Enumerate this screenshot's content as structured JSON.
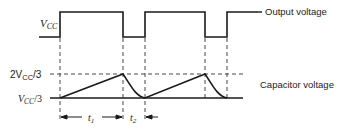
{
  "diagram": {
    "output": {
      "level_label_main": "V",
      "level_label_sub": "CC",
      "trace_label": "Output voltage"
    },
    "capacitor": {
      "upper_label_prefix": "2V",
      "upper_label_sub": "CC",
      "upper_label_suffix": "/3",
      "lower_label_prefix": "V",
      "lower_label_sub": "CC",
      "lower_label_suffix": "/3",
      "trace_label": "Capacitor voltage"
    },
    "intervals": {
      "t1_main": "t",
      "t1_sub": "1",
      "t2_main": "t",
      "t2_sub": "2"
    },
    "colors": {
      "line": "#1a1a1a",
      "dash": "#333333",
      "background": "#ffffff"
    }
  }
}
